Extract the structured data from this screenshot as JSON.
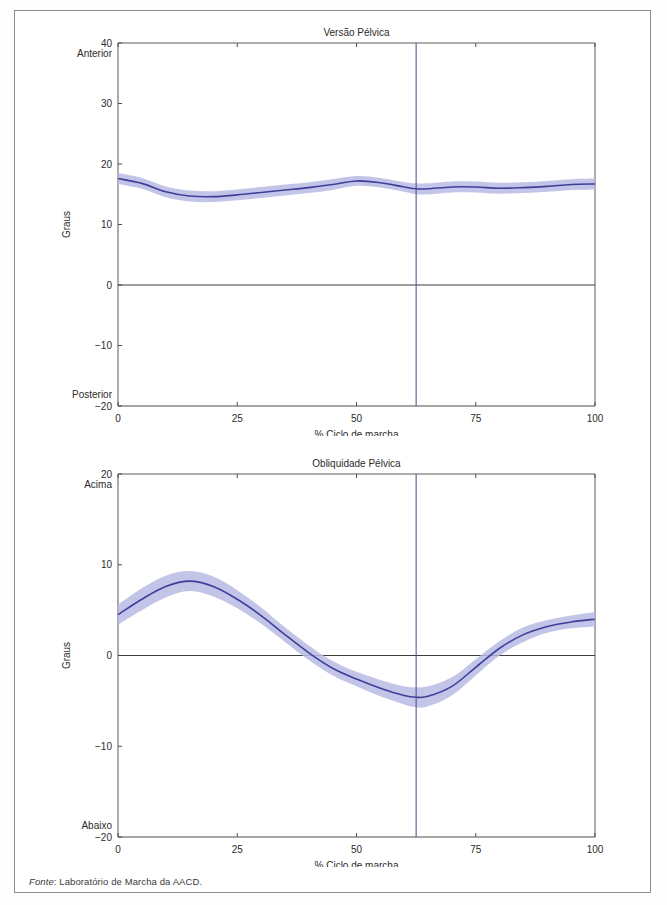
{
  "page": {
    "footer_prefix": "Fonte",
    "footer_text": ": Laboratório de Marcha da AACD."
  },
  "colors": {
    "curve": "#3f3f99",
    "band": "#b9bbe4",
    "axis": "#4d4d4d",
    "event_line": "#4a4a8f",
    "frame": "#8c8c8c"
  },
  "chart_data": [
    {
      "id": "versao-pelvica",
      "type": "line",
      "title": "Versão Pélvica",
      "xlabel": "% Ciclo de marcha",
      "ylabel": "Graus",
      "xlim": [
        0,
        100
      ],
      "ylim": [
        -20,
        40
      ],
      "xticks": [
        0,
        25,
        50,
        75,
        100
      ],
      "xticklabels": [
        "0",
        "25",
        "50",
        "75",
        "100"
      ],
      "yticks": [
        -20,
        -10,
        0,
        10,
        20,
        30,
        40
      ],
      "yticklabels": [
        "-20",
        "-10",
        "0",
        "10",
        "20",
        "30",
        "40"
      ],
      "top_annotation": "Anterior",
      "bottom_annotation": "Posterior",
      "grid": false,
      "legend": "none",
      "zero_line": 0,
      "event_marker_x": 62.5,
      "x": [
        0,
        5,
        10,
        15,
        20,
        25,
        30,
        35,
        40,
        45,
        50,
        55,
        60,
        62.5,
        65,
        70,
        75,
        80,
        85,
        90,
        95,
        100
      ],
      "series": [
        {
          "name": "Versão pélvica média",
          "values": [
            17.6,
            16.8,
            15.4,
            14.7,
            14.6,
            14.9,
            15.3,
            15.7,
            16.1,
            16.6,
            17.2,
            16.9,
            16.2,
            15.9,
            15.9,
            16.2,
            16.2,
            16.0,
            16.1,
            16.3,
            16.6,
            16.7
          ],
          "band_upper": [
            18.5,
            17.7,
            16.3,
            15.6,
            15.5,
            15.8,
            16.2,
            16.6,
            17.0,
            17.5,
            18.0,
            17.7,
            17.0,
            16.8,
            16.8,
            17.1,
            17.1,
            16.9,
            17.0,
            17.2,
            17.5,
            17.6
          ],
          "band_lower": [
            16.7,
            15.9,
            14.5,
            13.8,
            13.7,
            14.0,
            14.4,
            14.8,
            15.2,
            15.7,
            16.4,
            16.1,
            15.4,
            15.0,
            15.0,
            15.3,
            15.3,
            15.1,
            15.2,
            15.4,
            15.7,
            15.8
          ]
        }
      ]
    },
    {
      "id": "obliquidade-pelvica",
      "type": "line",
      "title": "Obliquidade Pélvica",
      "xlabel": "% Ciclo de marcha",
      "ylabel": "Graus",
      "xlim": [
        0,
        100
      ],
      "ylim": [
        -20,
        20
      ],
      "xticks": [
        0,
        25,
        50,
        75,
        100
      ],
      "xticklabels": [
        "0",
        "25",
        "50",
        "75",
        "100"
      ],
      "yticks": [
        -20,
        -10,
        0,
        10,
        20
      ],
      "yticklabels": [
        "-20",
        "-10",
        "0",
        "10",
        "20"
      ],
      "top_annotation": "Acima",
      "bottom_annotation": "Abaixo",
      "grid": false,
      "legend": "none",
      "zero_line": 0,
      "event_marker_x": 62.5,
      "x": [
        0,
        5,
        10,
        15,
        20,
        25,
        30,
        35,
        40,
        45,
        50,
        55,
        60,
        62.5,
        65,
        70,
        75,
        80,
        85,
        90,
        95,
        100
      ],
      "series": [
        {
          "name": "Obliquidade pélvica média",
          "values": [
            4.5,
            6.2,
            7.6,
            8.2,
            7.6,
            6.2,
            4.4,
            2.3,
            0.3,
            -1.4,
            -2.6,
            -3.6,
            -4.4,
            -4.6,
            -4.5,
            -3.4,
            -1.3,
            0.8,
            2.3,
            3.2,
            3.7,
            4.0
          ],
          "band_upper": [
            5.6,
            7.4,
            8.8,
            9.3,
            8.7,
            7.2,
            5.3,
            3.1,
            1.1,
            -0.6,
            -1.8,
            -2.7,
            -3.4,
            -3.5,
            -3.4,
            -2.4,
            -0.4,
            1.6,
            3.1,
            3.9,
            4.4,
            4.8
          ],
          "band_lower": [
            3.4,
            5.0,
            6.4,
            7.1,
            6.5,
            5.2,
            3.5,
            1.5,
            -0.5,
            -2.2,
            -3.4,
            -4.5,
            -5.4,
            -5.7,
            -5.6,
            -4.4,
            -2.2,
            0.0,
            1.5,
            2.5,
            3.0,
            3.2
          ]
        }
      ]
    }
  ]
}
